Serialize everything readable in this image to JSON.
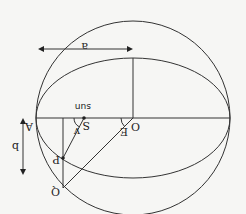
{
  "diagram": {
    "orientation": "rotated-180",
    "labels": {
      "center": "O",
      "vertex": "A",
      "sun_point": "S",
      "sun_text": "sun",
      "orbit_point": "P",
      "circle_point": "Q",
      "semi_major": "a",
      "semi_minor": "b",
      "true_anomaly": "v",
      "eccentric_anomaly": "E"
    },
    "colors": {
      "line": "#333333",
      "background": "#f6f6f4"
    }
  }
}
